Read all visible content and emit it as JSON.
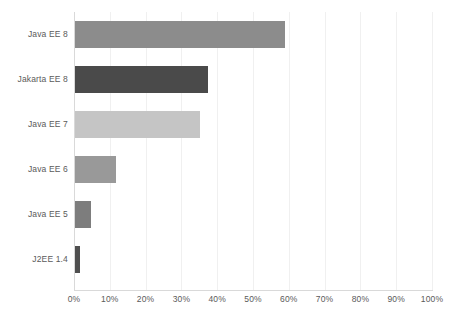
{
  "chart_data": {
    "type": "bar",
    "orientation": "horizontal",
    "title": "",
    "subtitle": "",
    "xlabel": "",
    "ylabel": "",
    "categories": [
      "Java EE 8",
      "Jakarta EE 8",
      "Java EE 7",
      "Java EE 6",
      "Java EE 5",
      "J2EE 1.4"
    ],
    "values": [
      58.9,
      37.4,
      35.2,
      11.7,
      4.7,
      1.7
    ],
    "value_suffix": "%",
    "xlim": [
      0,
      100
    ],
    "ylim": [
      0,
      6
    ],
    "xticks": [
      0,
      10,
      20,
      30,
      40,
      50,
      60,
      70,
      80,
      90,
      100
    ],
    "xtick_labels": [
      "0%",
      "10%",
      "20%",
      "30%",
      "40%",
      "50%",
      "60%",
      "70%",
      "80%",
      "90%",
      "100%"
    ],
    "grid": true,
    "grid_axis": "x",
    "legend": false,
    "legend_position": "none",
    "bar_colors": [
      "#8c8c8c",
      "#4a4a4a",
      "#c5c5c5",
      "#999999",
      "#7d7d7d",
      "#4f4f4f"
    ],
    "series": [
      {
        "name": "Usage share",
        "values": [
          58.9,
          37.4,
          35.2,
          11.7,
          4.7,
          1.7
        ]
      }
    ],
    "points": [
      {
        "category": "Java EE 8",
        "value": 58.9,
        "color": "#8c8c8c"
      },
      {
        "category": "Jakarta EE 8",
        "value": 37.4,
        "color": "#4a4a4a"
      },
      {
        "category": "Java EE 7",
        "value": 35.2,
        "color": "#c5c5c5"
      },
      {
        "category": "Java EE 6",
        "value": 11.7,
        "color": "#999999"
      },
      {
        "category": "Java EE 5",
        "value": 4.7,
        "color": "#7d7d7d"
      },
      {
        "category": "J2EE 1.4",
        "value": 1.7,
        "color": "#4f4f4f"
      }
    ],
    "style": {
      "background": "#ffffff",
      "gridline_color": "#f0f0f0",
      "axis_color": "#d9d9d9",
      "label_color": "#5a5a5a"
    }
  }
}
